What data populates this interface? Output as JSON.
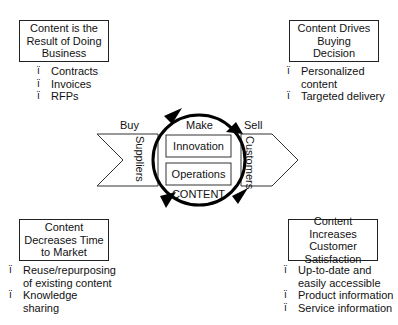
{
  "quadrants": {
    "top_left": {
      "title": "Content is the Result of Doing Business",
      "title_lines": [
        "Content is the",
        "Result of Doing",
        "Business"
      ],
      "bullets": [
        "Contracts",
        "Invoices",
        "RFPs"
      ]
    },
    "top_right": {
      "title": "Content Drives Buying Decision",
      "title_lines": [
        "Content Drives",
        "Buying",
        "Decision"
      ],
      "bullets": [
        "Personalized content",
        "Targeted delivery"
      ]
    },
    "bottom_left": {
      "title": "Content Decreases Time to Market",
      "title_lines": [
        "Content",
        "Decreases Time",
        "to Market"
      ],
      "bullets": [
        "Reuse/repurposing of existing content",
        "Knowledge sharing"
      ]
    },
    "bottom_right": {
      "title": "Content Increases Customer Satisfaction",
      "title_lines": [
        "Content Increases",
        "Customer",
        "Satisfaction"
      ],
      "bullets": [
        "Up-to-date and easily accessible",
        "Product information",
        "Service information"
      ]
    }
  },
  "bullet_glyph": "ï",
  "center": {
    "buy_label": "Buy",
    "make_label": "Make",
    "sell_label": "Sell",
    "suppliers_label": "Suppliers",
    "customers_label": "Customers",
    "innovation_label": "Innovation",
    "operations_label": "Operations",
    "content_label": "CONTENT"
  }
}
